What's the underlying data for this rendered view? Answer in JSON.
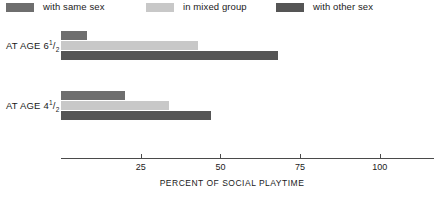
{
  "chart_data": {
    "type": "bar",
    "orientation": "horizontal",
    "title": "",
    "xlabel": "PERCENT OF SOCIAL PLAYTIME",
    "ylabel": "",
    "xlim": [
      0,
      117
    ],
    "xticks": [
      25,
      50,
      75,
      100
    ],
    "xtick_labels": [
      "25",
      "50",
      "75",
      "100"
    ],
    "grid": false,
    "legend_position": "top",
    "categories": [
      "AT AGE 6 1/2",
      "AT AGE 4 1/2"
    ],
    "series": [
      {
        "name": "with same sex",
        "color": "#6e6e6e",
        "values": [
          8,
          20
        ]
      },
      {
        "name": "in mixed group",
        "color": "#c8c8c8",
        "values": [
          43,
          34
        ]
      },
      {
        "name": "with other sex",
        "color": "#555555",
        "values": [
          68,
          47
        ]
      }
    ]
  },
  "legend": {
    "items": [
      {
        "label": "with same sex",
        "color": "#6e6e6e"
      },
      {
        "label": "in mixed group",
        "color": "#c8c8c8"
      },
      {
        "label": "with other sex",
        "color": "#555555"
      }
    ]
  },
  "groups": [
    {
      "label_prefix": "AT AGE 6",
      "frac_num": "1",
      "frac_slash": "/",
      "frac_den": "2",
      "bars": [
        {
          "series": "with same sex",
          "value": 8,
          "color": "#6e6e6e"
        },
        {
          "series": "in mixed group",
          "value": 43,
          "color": "#c8c8c8"
        },
        {
          "series": "with other sex",
          "value": 68,
          "color": "#555555"
        }
      ]
    },
    {
      "label_prefix": "AT AGE 4",
      "frac_num": "1",
      "frac_slash": "/",
      "frac_den": "2",
      "bars": [
        {
          "series": "with same sex",
          "value": 20,
          "color": "#6e6e6e"
        },
        {
          "series": "in mixed group",
          "value": 34,
          "color": "#c8c8c8"
        },
        {
          "series": "with other sex",
          "value": 47,
          "color": "#555555"
        }
      ]
    }
  ],
  "axis": {
    "title": "PERCENT OF SOCIAL PLAYTIME",
    "ticks": [
      {
        "value": 25,
        "label": "25"
      },
      {
        "value": 50,
        "label": "50"
      },
      {
        "value": 75,
        "label": "75"
      },
      {
        "value": 100,
        "label": "100"
      }
    ],
    "max": 117,
    "line_color": "#4a4a4a"
  }
}
